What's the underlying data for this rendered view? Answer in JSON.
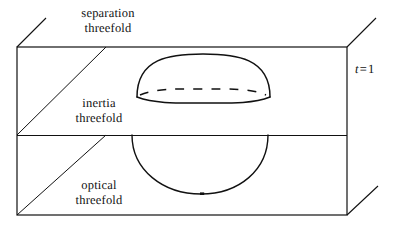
{
  "figure": {
    "background_color": "#ffffff",
    "stroke_color": "#111111",
    "width": 395,
    "height": 233
  },
  "labels": {
    "separation": {
      "line1": "separation",
      "line2": "threefold"
    },
    "inertia": {
      "line1": "inertia",
      "line2": "threefold"
    },
    "optical": {
      "line1": "optical",
      "line2": "threefold"
    },
    "t_value": {
      "variable": "t",
      "operator": "=",
      "value": "1"
    }
  },
  "geometry": {
    "front_face": {
      "left": 17,
      "top": 47,
      "right": 347,
      "bottom": 215
    },
    "divider_y": 135,
    "depth_offset_x": 30,
    "depth_offset_y": -28,
    "dome": {
      "cx": 203,
      "cy": 96,
      "rx": 66,
      "ry": 42,
      "ellipse_ry": 6
    },
    "lower_circle": {
      "cx": 200,
      "cy": 135,
      "rx": 68,
      "ry": 59,
      "marker_x": 202,
      "marker_y": 194
    }
  }
}
